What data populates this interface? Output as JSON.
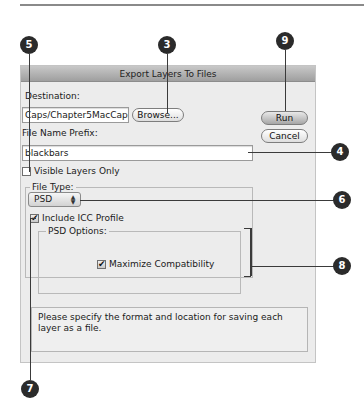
{
  "dialog": {
    "title": "Export Layers To Files",
    "destination": {
      "label": "Destination:",
      "value": "Caps/Chapter5MacCaps",
      "browse_label": "Browse..."
    },
    "buttons": {
      "run_label": "Run",
      "cancel_label": "Cancel"
    },
    "file_name_prefix": {
      "label": "File Name Prefix:",
      "value": "blackbars"
    },
    "visible_layers_only": {
      "label": "Visible Layers Only",
      "checked": false
    },
    "file_type": {
      "group_label": "File Type:",
      "selected": "PSD",
      "include_icc": {
        "label": "Include ICC Profile",
        "checked": true
      },
      "psd_options": {
        "group_label": "PSD Options:",
        "maximize_compatibility": {
          "label": "Maximize Compatibility",
          "checked": true
        }
      }
    },
    "info_text": "Please specify the format and location for saving each layer as a file."
  },
  "callouts": [
    {
      "number": "3"
    },
    {
      "number": "4"
    },
    {
      "number": "5"
    },
    {
      "number": "6"
    },
    {
      "number": "7"
    },
    {
      "number": "8"
    },
    {
      "number": "9"
    }
  ],
  "colors": {
    "callout_fill": "#2b2b2b",
    "dialog_bg": "#ececec",
    "titlebar": "#a8a8a8"
  },
  "icons": {
    "checkmark": "✔",
    "popup_arrows": "▲▼"
  }
}
